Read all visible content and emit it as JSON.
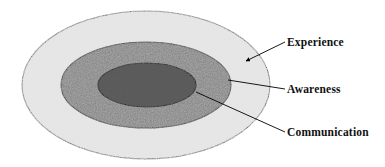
{
  "figure": {
    "type": "concentric-ellipse-diagram",
    "background_color": "#ffffff",
    "outline_color": "#000000",
    "rings": [
      {
        "id": "experience",
        "label": "Experience",
        "level": 1,
        "fill_description": "light grey stipple",
        "fill_color": "#e2e2e2",
        "cx": 146,
        "cy": 85,
        "rx": 124,
        "ry": 74
      },
      {
        "id": "awareness",
        "label": "Awareness",
        "level": 2,
        "fill_description": "medium grey stipple",
        "fill_color": "#a8a8a8",
        "cx": 146,
        "cy": 85,
        "rx": 85,
        "ry": 43
      },
      {
        "id": "communication",
        "label": "Communication",
        "level": 3,
        "fill_description": "dark grey stipple",
        "fill_color": "#5c5c5c",
        "cx": 147,
        "cy": 85,
        "rx": 49,
        "ry": 22
      }
    ],
    "leaders": [
      {
        "id": "experience-leader",
        "label": "Experience",
        "has_arrowhead": true,
        "from_x": 285,
        "from_y": 42,
        "to_x": 246,
        "to_y": 61
      },
      {
        "id": "awareness-leader",
        "label": "Awareness",
        "has_arrowhead": false,
        "from_x": 285,
        "from_y": 89,
        "to_x": 228,
        "to_y": 80
      },
      {
        "id": "communication-leader",
        "label": "Communication",
        "has_arrowhead": false,
        "from_x": 285,
        "from_y": 132,
        "to_x": 196,
        "to_y": 92
      }
    ]
  },
  "labels": {
    "experience": "Experience",
    "awareness": "Awareness",
    "communication": "Communication"
  }
}
